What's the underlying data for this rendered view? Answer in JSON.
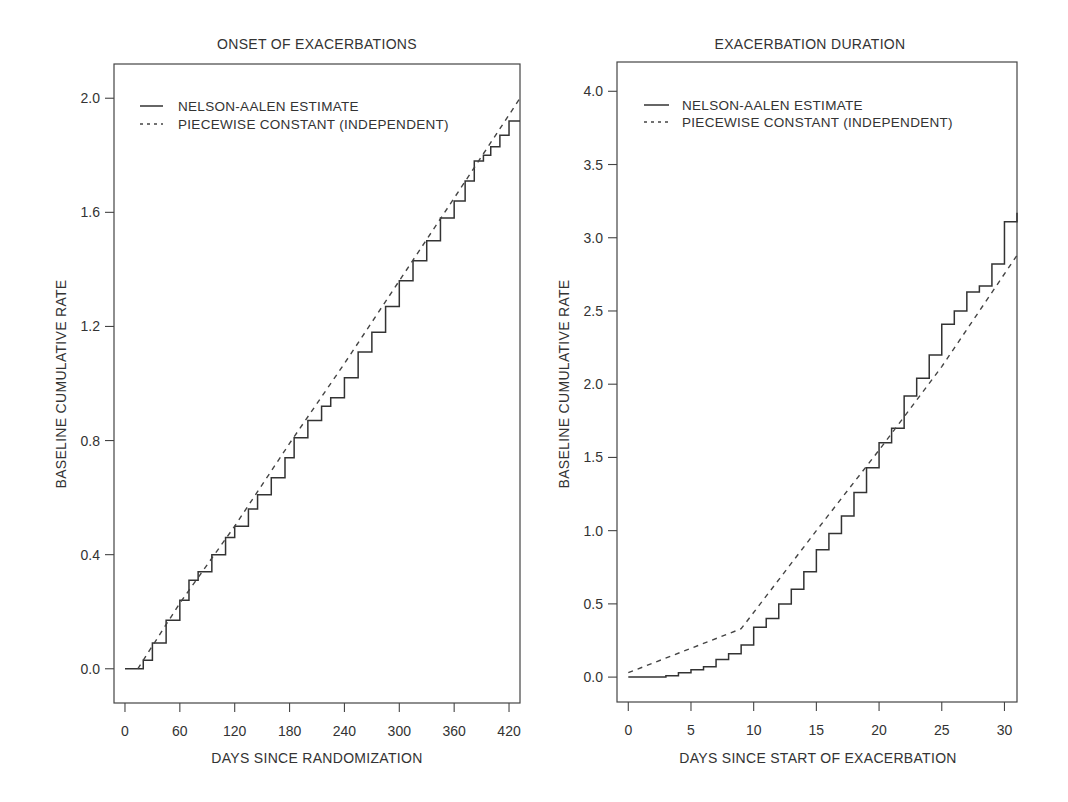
{
  "chart_data": [
    {
      "type": "line",
      "title": "ONSET OF EXACERBATIONS",
      "xlabel": "DAYS SINCE RANDOMIZATION",
      "ylabel": "BASELINE CUMULATIVE RATE",
      "xlim": [
        -12,
        432
      ],
      "ylim": [
        -0.12,
        2.12
      ],
      "xticks": [
        0,
        60,
        120,
        180,
        240,
        300,
        360,
        420
      ],
      "xtick_labels": [
        "0",
        "60",
        "120",
        "180",
        "240",
        "300",
        "360",
        "420"
      ],
      "yticks": [
        0.0,
        0.4,
        0.8,
        1.2,
        1.6,
        2.0
      ],
      "ytick_labels": [
        "0.0",
        "0.4",
        "0.8",
        "1.2",
        "1.6",
        "2.0"
      ],
      "grid": false,
      "legend": {
        "position": "upper left",
        "entries": [
          {
            "label": "NELSON-AALEN ESTIMATE",
            "style": "solid"
          },
          {
            "label": "PIECEWISE CONSTANT (INDEPENDENT)",
            "style": "dashed"
          }
        ]
      },
      "series": [
        {
          "name": "NELSON-AALEN ESTIMATE",
          "style": "step",
          "x": [
            0,
            14,
            20,
            30,
            45,
            60,
            70,
            80,
            95,
            110,
            120,
            135,
            145,
            160,
            175,
            185,
            200,
            215,
            225,
            240,
            255,
            270,
            285,
            300,
            315,
            330,
            345,
            360,
            372,
            382,
            392,
            400,
            410,
            420,
            432
          ],
          "y": [
            0.0,
            0.0,
            0.03,
            0.09,
            0.17,
            0.24,
            0.31,
            0.34,
            0.4,
            0.46,
            0.5,
            0.56,
            0.61,
            0.67,
            0.74,
            0.81,
            0.87,
            0.92,
            0.95,
            1.02,
            1.11,
            1.18,
            1.27,
            1.36,
            1.43,
            1.5,
            1.58,
            1.64,
            1.71,
            1.78,
            1.8,
            1.83,
            1.87,
            1.92,
            1.92
          ]
        },
        {
          "name": "PIECEWISE CONSTANT (INDEPENDENT)",
          "style": "dashed",
          "x": [
            14,
            60,
            120,
            180,
            240,
            300,
            360,
            432
          ],
          "y": [
            0.0,
            0.23,
            0.5,
            0.79,
            1.07,
            1.36,
            1.65,
            2.0
          ]
        }
      ]
    },
    {
      "type": "line",
      "title": "EXACERBATION DURATION",
      "xlabel": "DAYS SINCE START OF EXACERBATION",
      "ylabel": "BASELINE CUMULATIVE RATE",
      "xlim": [
        -0.9,
        31
      ],
      "ylim": [
        -0.17,
        4.2
      ],
      "xticks": [
        0,
        5,
        10,
        15,
        20,
        25,
        30
      ],
      "xtick_labels": [
        "0",
        "5",
        "10",
        "15",
        "20",
        "25",
        "30"
      ],
      "yticks": [
        0.0,
        0.5,
        1.0,
        1.5,
        2.0,
        2.5,
        3.0,
        3.5,
        4.0
      ],
      "ytick_labels": [
        "0.0",
        "0.5",
        "1.0",
        "1.5",
        "2.0",
        "2.5",
        "3.0",
        "3.5",
        "4.0"
      ],
      "grid": false,
      "legend": {
        "position": "upper left",
        "entries": [
          {
            "label": "NELSON-AALEN ESTIMATE",
            "style": "solid"
          },
          {
            "label": "PIECEWISE CONSTANT (INDEPENDENT)",
            "style": "dashed"
          }
        ]
      },
      "series": [
        {
          "name": "NELSON-AALEN ESTIMATE",
          "style": "step",
          "x": [
            0,
            3,
            4,
            5,
            6,
            7,
            8,
            9,
            10,
            11,
            12,
            13,
            14,
            15,
            16,
            17,
            18,
            19,
            20,
            21,
            22,
            23,
            24,
            25,
            26,
            27,
            28,
            29,
            30,
            31
          ],
          "y": [
            0.0,
            0.01,
            0.03,
            0.05,
            0.07,
            0.12,
            0.16,
            0.22,
            0.34,
            0.4,
            0.5,
            0.6,
            0.72,
            0.87,
            0.98,
            1.1,
            1.26,
            1.43,
            1.6,
            1.7,
            1.92,
            2.04,
            2.2,
            2.41,
            2.5,
            2.63,
            2.67,
            2.82,
            3.11,
            3.17
          ]
        },
        {
          "name": "PIECEWISE CONSTANT (INDEPENDENT)",
          "style": "dashed",
          "x": [
            0,
            9,
            15,
            20,
            25,
            31
          ],
          "y": [
            0.03,
            0.33,
            1.0,
            1.55,
            2.12,
            2.88
          ]
        }
      ]
    }
  ],
  "panels": [
    {
      "frame": {
        "left": 114,
        "top": 64,
        "right": 520,
        "bottom": 703
      }
    },
    {
      "frame": {
        "left": 617,
        "top": 62,
        "right": 1017,
        "bottom": 702
      }
    }
  ]
}
